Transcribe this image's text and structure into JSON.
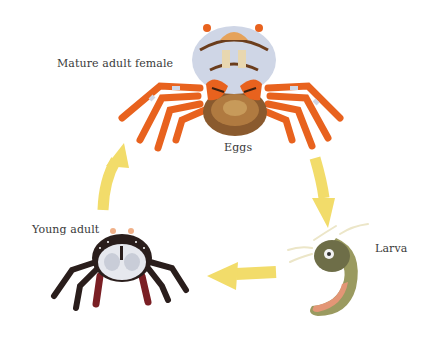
{
  "diagram": {
    "type": "life-cycle",
    "stages": [
      {
        "id": "mature",
        "label": "Mature adult female"
      },
      {
        "id": "eggs",
        "label": "Eggs"
      },
      {
        "id": "larva",
        "label": "Larva"
      },
      {
        "id": "young",
        "label": "Young adult"
      }
    ],
    "flow": [
      "Mature adult female / Eggs",
      "Larva",
      "Young adult",
      "Mature adult female"
    ],
    "colors": {
      "arrow": "#f2dc6a",
      "crab_orange": "#e8621e",
      "crab_shell_light": "#cfd6e6",
      "crab_brown": "#6b3d1c",
      "young_dark": "#2a1e1c",
      "young_red": "#7a1f24",
      "larva_olive": "#8a8a55",
      "larva_pink": "#e39676",
      "text": "#3a3a3a"
    }
  }
}
